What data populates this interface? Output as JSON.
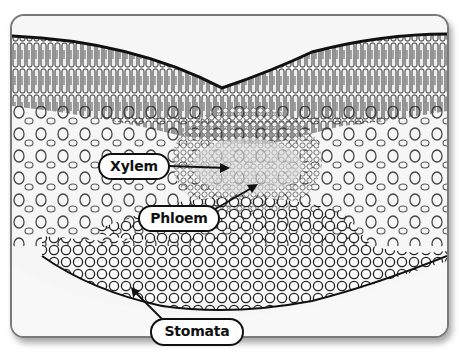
{
  "figure": {
    "labels": [
      {
        "id": "xylem",
        "text": "Xylem"
      },
      {
        "id": "phloem",
        "text": "Phloem"
      },
      {
        "id": "stomata",
        "text": "Stomata"
      }
    ],
    "colors": {
      "frame_border": "#7a7a7a",
      "label_border": "#111111",
      "label_fill": "#ffffff",
      "cell_wall": "#1a1a1a"
    }
  }
}
